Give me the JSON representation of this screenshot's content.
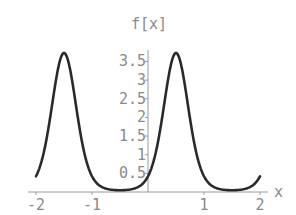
{
  "chart_data": {
    "type": "line",
    "title": "f[x]",
    "xlabel": "x",
    "ylabel": "f[x]",
    "xlim": [
      -2,
      2
    ],
    "ylim": [
      0,
      3.75
    ],
    "grid": false,
    "x_ticks": [
      "-2",
      "-1",
      "1",
      "2"
    ],
    "x_tick_values": [
      -2,
      -1,
      1,
      2
    ],
    "y_ticks": [
      "0.5",
      "1",
      "1.5",
      "2",
      "2.5",
      "3",
      "3.5"
    ],
    "y_tick_values": [
      0.5,
      1,
      1.5,
      2,
      2.5,
      3,
      3.5
    ],
    "series": [
      {
        "name": "f[x]",
        "x": [
          -2,
          -1.75,
          -1.5,
          -1.25,
          -1,
          -0.75,
          -0.5,
          -0.25,
          0,
          0.25,
          0.5,
          0.75,
          1,
          1.25,
          1.5,
          1.75,
          2
        ],
        "y": [
          0.42,
          1.97,
          3.73,
          1.97,
          0.42,
          0.09,
          0.05,
          0.09,
          0.42,
          1.97,
          3.73,
          1.97,
          0.42,
          0.09,
          0.05,
          0.09,
          0.42
        ]
      }
    ],
    "curve_model": {
      "amplitude": 3.73,
      "shape": 2.18,
      "peak_x": 0.5,
      "period": 2
    }
  },
  "colors": {
    "curve": "#2a2a2a",
    "axis": "#9a9a9a",
    "text": "#8a8a8a",
    "background": "#ffffff"
  }
}
